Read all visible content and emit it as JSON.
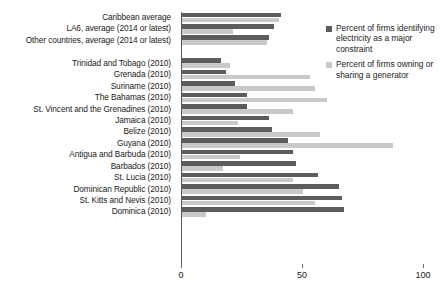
{
  "chart_data": {
    "type": "bar",
    "orientation": "horizontal",
    "title": "",
    "xlabel": "",
    "ylabel": "",
    "xlim": [
      0,
      100
    ],
    "xticks": [
      0,
      50,
      100
    ],
    "xtick_labels": [
      "0",
      "50",
      "100"
    ],
    "grid": false,
    "legend_position": "top-right",
    "categories": [
      "Caribbean average",
      "LA6, average (2014 or latest)",
      "Other countries, average (2014 or latest)",
      "",
      "Trinidad and Tobago (2010)",
      "Grenada (2010)",
      "Suriname (2010)",
      "The Bahamas (2010)",
      "St. Vincent and the Grenadines (2010)",
      "Jamaica (2010)",
      "Belize (2010)",
      "Guyana (2010)",
      "Antigua and Barbuda (2010)",
      "Barbados (2010)",
      "St. Lucia (2010)",
      "Dominican Republic (2010)",
      "St. Kitts and Nevis (2010)",
      "Dominica (2010)"
    ],
    "series": [
      {
        "name": "Percent of firms identifying electricity as a major constraint",
        "color": "#5c5c5c",
        "values": [
          41,
          38,
          36,
          null,
          16,
          18,
          22,
          27,
          27,
          36,
          37,
          44,
          46,
          47,
          56,
          65,
          66,
          67
        ]
      },
      {
        "name": "Percent of firms owning or sharing a generator",
        "color": "#c9c9c9",
        "values": [
          40,
          21,
          35,
          null,
          20,
          53,
          55,
          60,
          46,
          23,
          57,
          87,
          24,
          17,
          46,
          50,
          55,
          10
        ]
      }
    ]
  },
  "legend": {
    "items": [
      {
        "label": "Percent of firms identifying electricity as a major constraint",
        "color": "#5c5c5c"
      },
      {
        "label": "Percent of firms owning or sharing a generator",
        "color": "#c9c9c9"
      }
    ]
  }
}
